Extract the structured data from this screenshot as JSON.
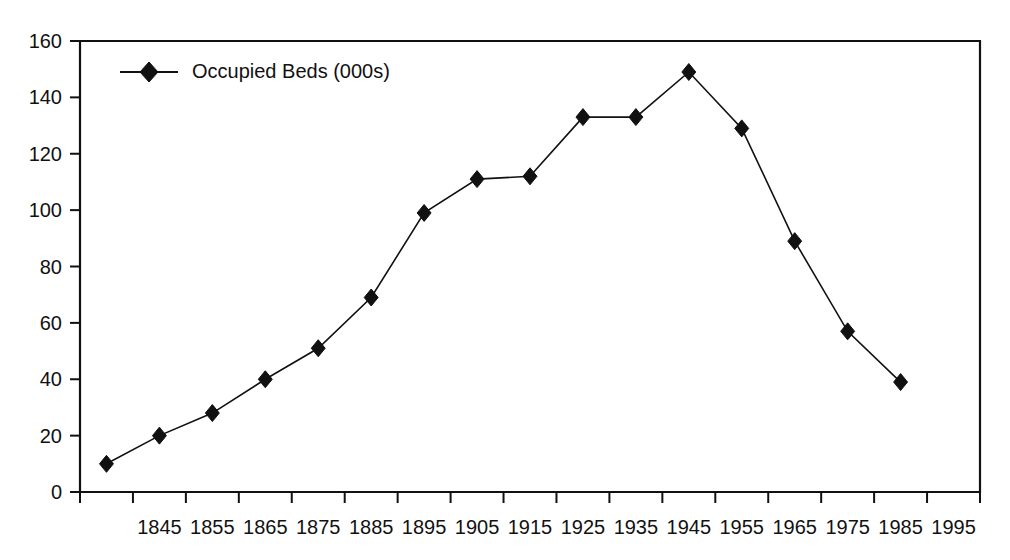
{
  "chart_data": {
    "type": "line",
    "title": "",
    "subtitle": "",
    "xlabel": "",
    "ylabel": "",
    "categories": [
      "1835",
      "1845",
      "1855",
      "1865",
      "1875",
      "1885",
      "1895",
      "1905",
      "1915",
      "1925",
      "1935",
      "1945",
      "1955",
      "1965",
      "1975",
      "1985",
      "1995"
    ],
    "x_tick_labels": [
      "",
      "1845",
      "1855",
      "1865",
      "1875",
      "1885",
      "1895",
      "1905",
      "1915",
      "1925",
      "1935",
      "1945",
      "1955",
      "1965",
      "1975",
      "1985",
      "1995"
    ],
    "series": [
      {
        "name": "Occupied Beds (000s)",
        "marker": "diamond",
        "color": "#111111",
        "values": [
          10,
          20,
          28,
          40,
          51,
          69,
          99,
          111,
          112,
          133,
          133,
          149,
          129,
          89,
          57,
          39,
          null
        ]
      }
    ],
    "y_ticks": [
      0,
      20,
      40,
      60,
      80,
      100,
      120,
      140,
      160
    ],
    "y_tick_labels": [
      "0",
      "20",
      "40",
      "60",
      "80",
      "100",
      "120",
      "140",
      "160"
    ],
    "ylim": [
      0,
      160
    ],
    "grid": false,
    "legend": {
      "position": "top-left-inside",
      "entries": [
        "Occupied Beds (000s)"
      ]
    },
    "frame": {
      "style": "box",
      "color": "#111111"
    }
  },
  "legend": {
    "label": "Occupied Beds (000s)"
  },
  "colors": {
    "series": "#111111",
    "axis": "#111111",
    "background": "#ffffff"
  }
}
